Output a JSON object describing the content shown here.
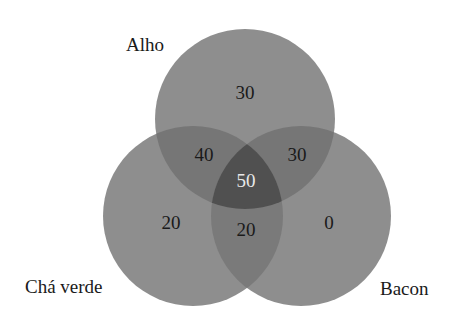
{
  "diagram": {
    "type": "venn-3",
    "sets": [
      {
        "id": "alho",
        "label": "Alho"
      },
      {
        "id": "cha_verde",
        "label": "Chá verde"
      },
      {
        "id": "bacon",
        "label": "Bacon"
      }
    ],
    "regions": {
      "alho_only": "30",
      "cha_verde_only": "20",
      "bacon_only": "0",
      "alho_cha_verde": "40",
      "alho_bacon": "30",
      "cha_verde_bacon": "20",
      "all_three": "50"
    },
    "colors": {
      "single": "#8e8e8e",
      "double": "#767676",
      "triple": "#505050",
      "text": "#1a1a1a",
      "text_light": "#e8e8e8",
      "background": "#ffffff"
    }
  }
}
